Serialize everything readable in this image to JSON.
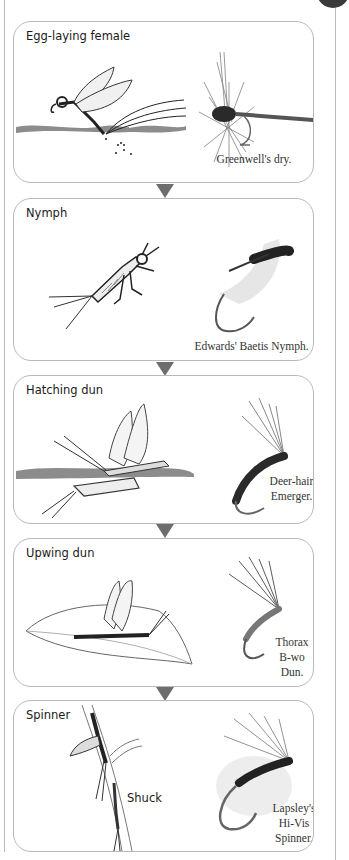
{
  "stages": [
    {
      "title": "Egg-laying female",
      "fly_caption": "Greenwell's dry.",
      "fly_name": "Greenwell's dry"
    },
    {
      "title": "Nymph",
      "fly_caption": "Edwards' Baetis Nymph.",
      "fly_name": "Edwards' Baetis Nymph"
    },
    {
      "title": "Hatching dun",
      "fly_caption_lines": [
        "Deer-hair",
        "Emerger."
      ],
      "fly_name": "Deer-hair Emerger"
    },
    {
      "title": "Upwing dun",
      "fly_caption_lines": [
        "Thorax",
        "B-wo",
        "Dun."
      ],
      "fly_name": "Thorax B-wo Dun"
    },
    {
      "title": "Spinner",
      "extra_label": "Shuck",
      "fly_caption_lines": [
        "Lapsley's",
        "Hi-Vis",
        "Spinner."
      ],
      "fly_name": "Lapsley's Hi-Vis Spinner"
    }
  ],
  "colors": {
    "box_border": "#b9b9b9",
    "arrow": "#6d6d6d",
    "water": "#8c8c8c",
    "page_line": "#bdbdbd"
  },
  "flow_direction": "top-to-bottom"
}
